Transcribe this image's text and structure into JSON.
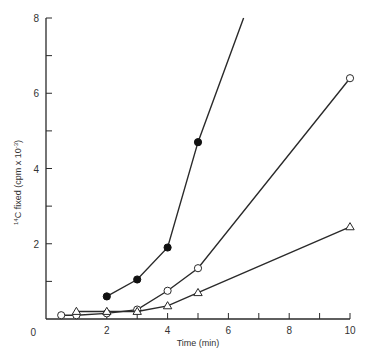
{
  "chart_data": {
    "type": "line",
    "title": "",
    "xlabel": "Time (min)",
    "ylabel": "14C fixed (cpm x 10^-3)",
    "ylabel_parts": {
      "sup": "14",
      "main": "C  fixed  (cpm x 10",
      "exp": "-3",
      "close": ")"
    },
    "xlim": [
      0,
      10
    ],
    "ylim": [
      0,
      8
    ],
    "x_ticks": [
      0,
      2,
      4,
      6,
      8,
      10
    ],
    "x_minor_ticks": [
      1,
      3,
      5,
      7,
      9
    ],
    "y_ticks": [
      2,
      4,
      6,
      8
    ],
    "y_minor_ticks": [
      1,
      3,
      5,
      7
    ],
    "origin_label": "0",
    "grid": false,
    "legend": null,
    "series": [
      {
        "name": "filled circles",
        "marker": "filled-circle",
        "x": [
          2,
          3,
          4,
          5
        ],
        "y": [
          0.6,
          1.05,
          1.9,
          4.7
        ],
        "line_extends_to": [
          6.5,
          8.0
        ]
      },
      {
        "name": "open circles",
        "marker": "open-circle",
        "x": [
          0.5,
          1,
          2,
          3,
          4,
          5,
          10
        ],
        "y": [
          0.1,
          0.1,
          0.15,
          0.25,
          0.75,
          1.35,
          6.4
        ]
      },
      {
        "name": "open triangles",
        "marker": "open-triangle",
        "x": [
          1,
          2,
          3,
          4,
          5,
          10
        ],
        "y": [
          0.2,
          0.2,
          0.2,
          0.35,
          0.7,
          2.45
        ]
      }
    ]
  },
  "labels": {
    "x_title": "Time (min)",
    "origin": "0",
    "x_ticks": [
      "2",
      "4",
      "6",
      "8",
      "10"
    ],
    "y_ticks": [
      "2",
      "4",
      "6",
      "8"
    ]
  }
}
